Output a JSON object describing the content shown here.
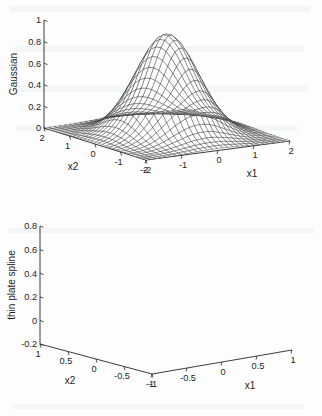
{
  "page": {
    "background_color": "#fdfdfd",
    "ink_color": "#1c1c1c",
    "mesh_color": "#3a3a3a"
  },
  "chart_data": [
    {
      "id": "gaussian",
      "type": "surface",
      "title": "",
      "zlabel": "Gaussian",
      "xlabel": "x1",
      "ylabel": "x2",
      "xlim": [
        -2,
        2
      ],
      "ylim": [
        -2,
        2
      ],
      "zlim": [
        0,
        1
      ],
      "xticks": [
        -2,
        -1,
        0,
        1,
        2
      ],
      "xtick_labels": [
        "-2",
        "-1",
        "0",
        "1",
        "2"
      ],
      "yticks": [
        2,
        1,
        0,
        -1,
        -2
      ],
      "ytick_labels": [
        "2",
        "1",
        "0",
        "-1",
        "-2"
      ],
      "zticks": [
        0,
        0.2,
        0.4,
        0.6,
        0.8,
        1
      ],
      "ztick_labels": [
        "0",
        "0.2",
        "0.4",
        "0.6",
        "0.8",
        "1"
      ],
      "function": "gaussian",
      "sigma": 0.72,
      "peak": 0.93,
      "grid_n": 28,
      "grid": true,
      "legend": "none"
    },
    {
      "id": "thin-plate-spline",
      "type": "surface",
      "title": "",
      "zlabel": "thin plate spline",
      "xlabel": "x1",
      "ylabel": "x2",
      "xlim": [
        -1,
        1
      ],
      "ylim": [
        -1,
        1
      ],
      "zlim": [
        -0.2,
        0.8
      ],
      "xticks": [
        -1,
        -0.5,
        0,
        0.5,
        1
      ],
      "xtick_labels": [
        "-1",
        "-0.5",
        "0",
        "0.5",
        "1"
      ],
      "yticks": [
        1,
        0.5,
        0,
        -0.5,
        -1
      ],
      "ytick_labels": [
        "1",
        "0.5",
        "0",
        "-0.5",
        "-1"
      ],
      "zticks": [
        -0.2,
        0,
        0.2,
        0.4,
        0.6,
        0.8
      ],
      "ztick_labels": [
        "-0.2",
        "0",
        "0.2",
        "0.4",
        "0.6",
        "0.8"
      ],
      "function": "thin-plate-spline",
      "coefficient": 1.0,
      "grid_n": 26,
      "grid": true,
      "legend": "none"
    }
  ]
}
